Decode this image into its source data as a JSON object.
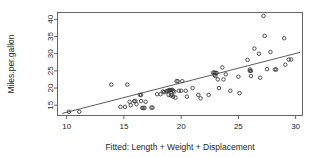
{
  "chart_data": {
    "type": "scatter",
    "title": "",
    "xlabel": "Fitted: Length + Weight + Displacement",
    "ylabel": "Miles.per.gallon",
    "xlim": [
      9.2,
      30.6
    ],
    "ylim": [
      12.0,
      42.0
    ],
    "xticks": [
      10,
      15,
      20,
      25,
      30
    ],
    "xtick_labels": [
      "10",
      "15",
      "20",
      "25",
      "30"
    ],
    "yticks": [
      15,
      20,
      25,
      30,
      35,
      40
    ],
    "ytick_labels": [
      "15",
      "20",
      "25",
      "30",
      "35",
      "40"
    ],
    "grid": false,
    "legend": null,
    "marker": "open-circle",
    "marker_color": "#333333",
    "line_color": "#4a4a4a",
    "frame_color": "#555555",
    "fit_line": {
      "name": "least-squares fit",
      "x": [
        9.6,
        30.4
      ],
      "y": [
        12.6,
        30.4
      ]
    },
    "points": [
      [
        10.2,
        13.1
      ],
      [
        11.1,
        13.1
      ],
      [
        13.9,
        21.0
      ],
      [
        14.7,
        14.5
      ],
      [
        15.1,
        14.5
      ],
      [
        15.3,
        21.0
      ],
      [
        15.5,
        16.0
      ],
      [
        15.6,
        15.0
      ],
      [
        15.9,
        16.2
      ],
      [
        16.0,
        16.2
      ],
      [
        16.1,
        15.3
      ],
      [
        16.4,
        18.0
      ],
      [
        16.5,
        18.0
      ],
      [
        16.5,
        16.2
      ],
      [
        16.6,
        14.2
      ],
      [
        16.7,
        14.2
      ],
      [
        16.8,
        14.2
      ],
      [
        16.9,
        16.0
      ],
      [
        17.4,
        14.3
      ],
      [
        17.5,
        14.3
      ],
      [
        17.9,
        18.2
      ],
      [
        18.2,
        18.2
      ],
      [
        18.4,
        19.0
      ],
      [
        18.5,
        18.8
      ],
      [
        18.7,
        19.0
      ],
      [
        18.8,
        19.2
      ],
      [
        18.9,
        19.2
      ],
      [
        18.9,
        18.0
      ],
      [
        19.0,
        19.3
      ],
      [
        19.0,
        19.4
      ],
      [
        19.1,
        19.4
      ],
      [
        19.1,
        17.8
      ],
      [
        19.2,
        19.5
      ],
      [
        19.2,
        18.0
      ],
      [
        19.3,
        19.2
      ],
      [
        19.3,
        17.5
      ],
      [
        19.4,
        19.0
      ],
      [
        19.5,
        17.2
      ],
      [
        19.6,
        22.0
      ],
      [
        19.7,
        22.0
      ],
      [
        19.8,
        19.2
      ],
      [
        20.0,
        19.2
      ],
      [
        20.1,
        22.0
      ],
      [
        20.4,
        19.2
      ],
      [
        20.5,
        17.5
      ],
      [
        21.0,
        20.0
      ],
      [
        21.5,
        18.0
      ],
      [
        21.7,
        17.0
      ],
      [
        22.4,
        18.0
      ],
      [
        22.8,
        24.5
      ],
      [
        22.9,
        24.5
      ],
      [
        22.9,
        23.8
      ],
      [
        23.0,
        24.4
      ],
      [
        23.0,
        23.5
      ],
      [
        23.1,
        24.4
      ],
      [
        23.2,
        22.5
      ],
      [
        23.3,
        20.0
      ],
      [
        23.6,
        26.0
      ],
      [
        23.7,
        22.5
      ],
      [
        23.9,
        24.0
      ],
      [
        24.3,
        19.2
      ],
      [
        25.0,
        23.3
      ],
      [
        25.1,
        18.5
      ],
      [
        25.8,
        28.2
      ],
      [
        26.0,
        25.4
      ],
      [
        26.0,
        25.0
      ],
      [
        26.1,
        25.0
      ],
      [
        26.1,
        23.5
      ],
      [
        26.4,
        31.5
      ],
      [
        26.8,
        30.0
      ],
      [
        26.9,
        23.0
      ],
      [
        27.2,
        41.0
      ],
      [
        27.3,
        35.2
      ],
      [
        27.5,
        25.5
      ],
      [
        27.8,
        30.5
      ],
      [
        28.2,
        25.4
      ],
      [
        28.3,
        25.4
      ],
      [
        29.0,
        34.5
      ],
      [
        29.1,
        26.8
      ],
      [
        29.4,
        28.3
      ],
      [
        29.6,
        28.3
      ]
    ]
  },
  "axis": {
    "x_title": "Fitted: Length + Weight + Displacement",
    "y_title": "Miles.per.gallon"
  }
}
